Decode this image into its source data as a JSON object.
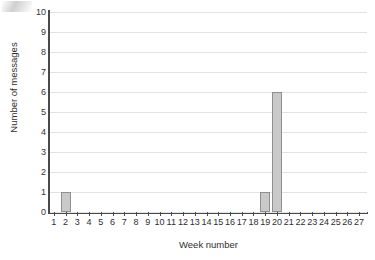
{
  "chart_data": {
    "type": "bar",
    "title": "",
    "subtitle": "",
    "xlabel": "Week number",
    "ylabel": "Number of messages",
    "categories": [
      1,
      2,
      3,
      4,
      5,
      6,
      7,
      8,
      9,
      10,
      11,
      12,
      13,
      14,
      15,
      16,
      17,
      18,
      19,
      20,
      21,
      22,
      23,
      24,
      25,
      26,
      27
    ],
    "values": [
      0,
      1,
      0,
      0,
      0,
      0,
      0,
      0,
      0,
      0,
      0,
      0,
      0,
      0,
      0,
      0,
      0,
      0,
      1,
      6,
      0,
      0,
      0,
      0,
      0,
      0,
      0
    ],
    "x_tick_labels": [
      "1",
      "2",
      "3",
      "4",
      "5",
      "6",
      "7",
      "8",
      "9",
      "10",
      "11",
      "12",
      "13",
      "14",
      "15",
      "16",
      "17",
      "18",
      "19",
      "20",
      "21",
      "22",
      "23",
      "24",
      "25",
      "26",
      "27"
    ],
    "y_tick_labels": [
      "0",
      "1",
      "2",
      "3",
      "4",
      "5",
      "6",
      "7",
      "8",
      "9",
      "10"
    ],
    "y_ticks": [
      0,
      1,
      2,
      3,
      4,
      5,
      6,
      7,
      8,
      9,
      10
    ],
    "ylim": [
      0,
      10
    ],
    "xlim": [
      0.5,
      27.5
    ],
    "grid": "horizontal",
    "legend": "none",
    "annotations": [],
    "colors": {
      "bar_fill": "#c9c9c9",
      "bar_border": "#8f8f8f",
      "gridline": "#e2e2e2",
      "axis": "#4a4a4a",
      "text": "#2e2e2e",
      "background": "#ffffff"
    },
    "nonzero_points": [
      {
        "week": 2,
        "messages": 1
      },
      {
        "week": 19,
        "messages": 1
      },
      {
        "week": 20,
        "messages": 6
      }
    ]
  }
}
